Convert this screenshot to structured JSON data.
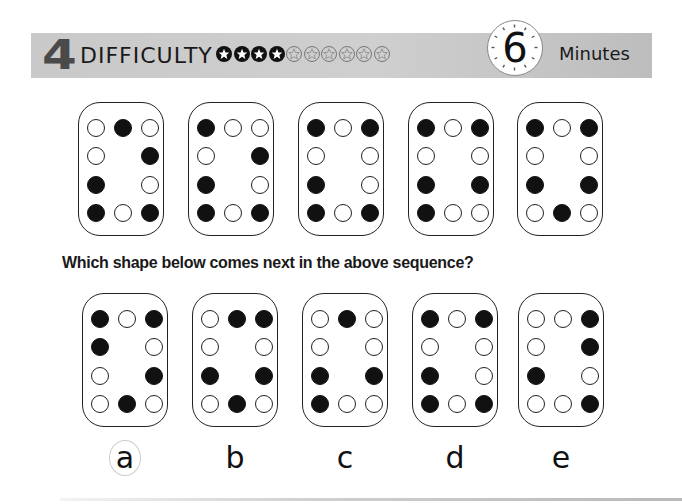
{
  "header": {
    "level_number": "4",
    "difficulty_label": "DIFFICULTY",
    "difficulty_rating": 4,
    "difficulty_max": 10,
    "stars": [
      "filled",
      "filled",
      "filled",
      "filled",
      "empty",
      "empty",
      "empty",
      "empty",
      "empty",
      "empty"
    ],
    "time_value": "6",
    "time_unit": "Minutes",
    "bar_color": "#c9c9c9"
  },
  "sequence": {
    "shapes": [
      {
        "grid": [
          [
            0,
            1,
            0
          ],
          [
            0,
            null,
            1
          ],
          [
            1,
            null,
            0
          ],
          [
            1,
            0,
            1
          ]
        ]
      },
      {
        "grid": [
          [
            1,
            0,
            0
          ],
          [
            0,
            null,
            1
          ],
          [
            1,
            null,
            0
          ],
          [
            1,
            0,
            1
          ]
        ]
      },
      {
        "grid": [
          [
            1,
            0,
            1
          ],
          [
            0,
            null,
            0
          ],
          [
            1,
            null,
            0
          ],
          [
            1,
            0,
            1
          ]
        ]
      },
      {
        "grid": [
          [
            1,
            0,
            1
          ],
          [
            0,
            null,
            0
          ],
          [
            1,
            null,
            1
          ],
          [
            1,
            0,
            0
          ]
        ]
      },
      {
        "grid": [
          [
            1,
            0,
            1
          ],
          [
            0,
            null,
            0
          ],
          [
            1,
            null,
            1
          ],
          [
            0,
            1,
            0
          ]
        ]
      }
    ]
  },
  "question": {
    "text": "Which shape below comes next in the above sequence?"
  },
  "options": [
    {
      "label": "a",
      "circled": true,
      "grid": [
        [
          1,
          0,
          1
        ],
        [
          1,
          null,
          0
        ],
        [
          0,
          null,
          1
        ],
        [
          0,
          1,
          0
        ]
      ]
    },
    {
      "label": "b",
      "circled": false,
      "grid": [
        [
          0,
          1,
          1
        ],
        [
          0,
          null,
          0
        ],
        [
          1,
          null,
          1
        ],
        [
          0,
          1,
          0
        ]
      ]
    },
    {
      "label": "c",
      "circled": false,
      "grid": [
        [
          0,
          1,
          0
        ],
        [
          0,
          null,
          0
        ],
        [
          1,
          null,
          1
        ],
        [
          1,
          0,
          0
        ]
      ]
    },
    {
      "label": "d",
      "circled": false,
      "grid": [
        [
          1,
          0,
          1
        ],
        [
          0,
          null,
          0
        ],
        [
          1,
          null,
          0
        ],
        [
          1,
          0,
          1
        ]
      ]
    },
    {
      "label": "e",
      "circled": false,
      "grid": [
        [
          0,
          0,
          1
        ],
        [
          0,
          null,
          1
        ],
        [
          1,
          null,
          0
        ],
        [
          0,
          0,
          1
        ]
      ]
    }
  ]
}
